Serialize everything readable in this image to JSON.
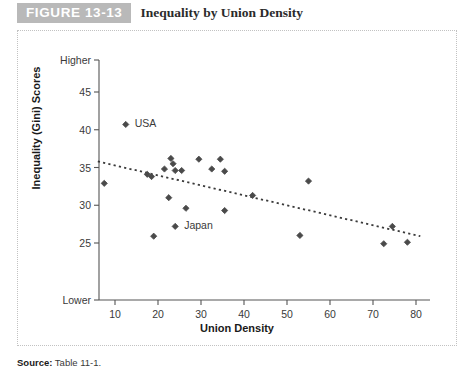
{
  "figure": {
    "badge": "FIGURE 13-13",
    "title": "Inequality by Union Density",
    "source_label": "Source:",
    "source_text": "Table 11-1.",
    "badge_bg": "#b9b9b9",
    "frame_color": "#c2c2c2"
  },
  "chart_data": {
    "type": "scatter",
    "title": "Inequality by Union Density",
    "xlabel": "Union Density",
    "ylabel": "Inequality (Gini) Scores",
    "xlim": [
      5,
      82
    ],
    "ylim": [
      22,
      48
    ],
    "grid": false,
    "legend": "none",
    "xticks": [
      10,
      20,
      30,
      40,
      50,
      60,
      70,
      80
    ],
    "yticks": [
      25,
      30,
      35,
      40,
      45
    ],
    "y_axis_top_label": "Higher",
    "y_axis_bottom_label": "Lower",
    "marker": "diamond",
    "marker_color": "#4a4a4a",
    "trendline": {
      "style": "dotted",
      "color": "#3a3a3a",
      "x_start": 6.0,
      "y_start": 35.8,
      "x_end": 81.0,
      "y_end": 25.9
    },
    "points": [
      {
        "x": 7.5,
        "y": 32.9,
        "label": ""
      },
      {
        "x": 12.5,
        "y": 40.7,
        "label": "USA"
      },
      {
        "x": 17.5,
        "y": 34.1,
        "label": ""
      },
      {
        "x": 18.5,
        "y": 33.8,
        "label": ""
      },
      {
        "x": 19.0,
        "y": 25.9,
        "label": ""
      },
      {
        "x": 21.5,
        "y": 34.8,
        "label": ""
      },
      {
        "x": 22.5,
        "y": 31.0,
        "label": ""
      },
      {
        "x": 23.0,
        "y": 36.2,
        "label": ""
      },
      {
        "x": 23.5,
        "y": 35.5,
        "label": ""
      },
      {
        "x": 24.0,
        "y": 34.6,
        "label": ""
      },
      {
        "x": 24.0,
        "y": 27.2,
        "label": "Japan"
      },
      {
        "x": 25.5,
        "y": 34.6,
        "label": ""
      },
      {
        "x": 26.5,
        "y": 29.6,
        "label": ""
      },
      {
        "x": 29.5,
        "y": 36.1,
        "label": ""
      },
      {
        "x": 32.5,
        "y": 34.8,
        "label": ""
      },
      {
        "x": 34.5,
        "y": 36.1,
        "label": ""
      },
      {
        "x": 35.5,
        "y": 34.5,
        "label": ""
      },
      {
        "x": 35.5,
        "y": 29.3,
        "label": ""
      },
      {
        "x": 42.0,
        "y": 31.3,
        "label": ""
      },
      {
        "x": 53.0,
        "y": 26.0,
        "label": ""
      },
      {
        "x": 55.0,
        "y": 33.2,
        "label": ""
      },
      {
        "x": 72.5,
        "y": 24.9,
        "label": ""
      },
      {
        "x": 74.5,
        "y": 27.2,
        "label": ""
      },
      {
        "x": 78.0,
        "y": 25.1,
        "label": ""
      }
    ],
    "annotations": [
      {
        "text": "USA",
        "x": 12.5,
        "y": 40.7
      },
      {
        "text": "Japan",
        "x": 24.0,
        "y": 27.2
      }
    ]
  }
}
